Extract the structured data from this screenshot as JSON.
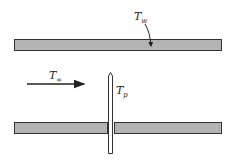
{
  "diagram": {
    "title": "",
    "colors": {
      "wall_fill": "#b4b4b4",
      "stroke": "#333333",
      "probe_fill": "#ffffff"
    },
    "labels": {
      "wall_temp": {
        "main": "T",
        "sub": "w"
      },
      "free_stream_temp": {
        "main": "T",
        "sub": "∞"
      },
      "probe_temp": {
        "main": "T",
        "sub": "p"
      }
    },
    "elements": [
      {
        "id": "top-wall",
        "type": "rect",
        "label_ref": "wall_temp"
      },
      {
        "id": "bottom-wall-left",
        "type": "rect"
      },
      {
        "id": "bottom-wall-right",
        "type": "rect"
      },
      {
        "id": "probe",
        "type": "rod",
        "label_ref": "probe_temp"
      },
      {
        "id": "flow-arrow",
        "type": "arrow",
        "direction": "right",
        "label_ref": "free_stream_temp"
      }
    ]
  }
}
